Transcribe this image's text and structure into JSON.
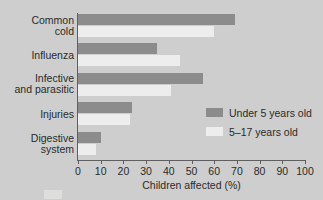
{
  "chart_data": {
    "type": "bar",
    "orientation": "horizontal",
    "title": "",
    "xlabel": "Children affected (%)",
    "ylabel": "",
    "xlim": [
      0,
      100
    ],
    "xticks": [
      0,
      10,
      20,
      30,
      40,
      50,
      60,
      70,
      80,
      90,
      100
    ],
    "xtick_labels": [
      "0",
      "10",
      "20",
      "30",
      "40",
      "50",
      "60",
      "70",
      "80",
      "90",
      "100"
    ],
    "grid": false,
    "legend_position": "center-right",
    "categories": [
      "Common\ncold",
      "Influenza",
      "Infective\nand parasitic",
      "Injuries",
      "Digestive\nsystem"
    ],
    "series": [
      {
        "name": "Under 5 years old",
        "color": "#8b8c8b",
        "values": [
          69,
          35,
          55,
          24,
          10
        ]
      },
      {
        "name": "5–17 years old",
        "color": "#ecedec",
        "values": [
          60,
          45,
          41,
          23,
          8
        ]
      }
    ]
  },
  "colors": {
    "background": "#cdcecd",
    "axis": "#5e5f5e",
    "text": "#2b2b2b",
    "under5": "#8b8c8b",
    "age5to17": "#ecedec"
  },
  "legend": {
    "items": [
      {
        "label": "Under 5 years old",
        "swatch": "under5"
      },
      {
        "label": "5–17 years old",
        "swatch": "age5to17"
      }
    ]
  }
}
